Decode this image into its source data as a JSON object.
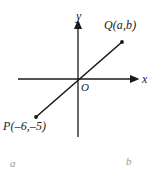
{
  "figure": {
    "type": "coordinate-plane-diagram",
    "background_color": "#ffffff",
    "ink_color": "#1a1a1a",
    "caption_color": "#9a9a9a"
  },
  "axes": {
    "y_label": "y",
    "x_label": "x",
    "origin_label": "O",
    "x_axis": {
      "x1": 18,
      "y1": 79,
      "x2": 137,
      "y2": 79,
      "arrow": "right"
    },
    "y_axis": {
      "x1": 78,
      "y1": 137,
      "x2": 78,
      "y2": 22,
      "arrow": "up"
    }
  },
  "line_segment": {
    "from": {
      "px": 36,
      "py": 117
    },
    "to": {
      "px": 122,
      "py": 42
    },
    "passes_through_origin": true
  },
  "points": [
    {
      "name": "P",
      "label": "P(–6,–5)",
      "coordinates": {
        "x": -6,
        "y": -5
      },
      "px": 36,
      "py": 117
    },
    {
      "name": "Q",
      "label": "Q(a,b)",
      "coordinates": {
        "x": "a",
        "y": "b"
      },
      "px": 122,
      "py": 42
    }
  ],
  "captions": {
    "left": "a",
    "right": "b"
  }
}
